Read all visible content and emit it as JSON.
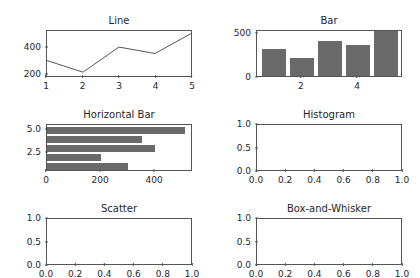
{
  "figure": {
    "background": "#ffffff",
    "bar_color": "#6a6a6a",
    "line_color": "#555555",
    "axis_color": "#555555",
    "text_color": "#262626",
    "rows": 3,
    "cols": 2
  },
  "chart_data": [
    {
      "type": "line",
      "title": "Line",
      "xlabel": "",
      "ylabel": "",
      "x": [
        1,
        2,
        3,
        4,
        5
      ],
      "values": [
        300,
        210,
        405,
        355,
        510
      ],
      "xlim": [
        1,
        5
      ],
      "ylim": [
        180,
        530
      ],
      "xticks": [
        1,
        2,
        3,
        4,
        5
      ],
      "xticklabels": [
        "1",
        "2",
        "3",
        "4",
        "5"
      ],
      "yticks": [
        200,
        400
      ],
      "yticklabels": [
        "200",
        "400"
      ],
      "grid": false,
      "legend": false
    },
    {
      "type": "bar",
      "title": "Bar",
      "xlabel": "",
      "ylabel": "",
      "categories": [
        1,
        2,
        3,
        4,
        5
      ],
      "values": [
        305,
        205,
        400,
        350,
        510
      ],
      "xlim": [
        0.4,
        5.6
      ],
      "ylim": [
        0,
        530
      ],
      "xticks": [
        2,
        4
      ],
      "xticklabels": [
        "2",
        "4"
      ],
      "yticks": [
        0,
        500
      ],
      "yticklabels": [
        "0",
        "500"
      ],
      "grid": false,
      "legend": false
    },
    {
      "type": "barh",
      "title": "Horizontal Bar",
      "xlabel": "",
      "ylabel": "",
      "categories": [
        1,
        2,
        3,
        4,
        5
      ],
      "values": [
        300,
        200,
        400,
        350,
        510
      ],
      "xlim": [
        0,
        540
      ],
      "ylim": [
        0.4,
        5.6
      ],
      "xticks": [
        0,
        200,
        400
      ],
      "xticklabels": [
        "0",
        "200",
        "400"
      ],
      "yticks": [
        2.5,
        5.0
      ],
      "yticklabels": [
        "2.5",
        "5.0"
      ],
      "grid": false,
      "legend": false
    },
    {
      "type": "histogram",
      "title": "Histogram",
      "xlabel": "",
      "ylabel": "",
      "values": [],
      "xlim": [
        0.0,
        1.0
      ],
      "ylim": [
        0.0,
        1.0
      ],
      "xticks": [
        0.0,
        0.2,
        0.4,
        0.6,
        0.8,
        1.0
      ],
      "xticklabels": [
        "0.0",
        "0.2",
        "0.4",
        "0.6",
        "0.8",
        "1.0"
      ],
      "yticks": [
        0.0,
        0.5,
        1.0
      ],
      "yticklabels": [
        "0.0",
        "0.5",
        "1.0"
      ],
      "grid": false,
      "legend": false,
      "empty": true
    },
    {
      "type": "scatter",
      "title": "Scatter",
      "xlabel": "",
      "ylabel": "",
      "x": [],
      "values": [],
      "xlim": [
        0.0,
        1.0
      ],
      "ylim": [
        0.0,
        1.0
      ],
      "xticks": [
        0.0,
        0.2,
        0.4,
        0.6,
        0.8,
        1.0
      ],
      "xticklabels": [
        "0.0",
        "0.2",
        "0.4",
        "0.6",
        "0.8",
        "1.0"
      ],
      "yticks": [
        0.0,
        0.5,
        1.0
      ],
      "yticklabels": [
        "0.0",
        "0.5",
        "1.0"
      ],
      "grid": false,
      "legend": false,
      "empty": true
    },
    {
      "type": "box",
      "title": "Box-and-Whisker",
      "xlabel": "",
      "ylabel": "",
      "values": [],
      "xlim": [
        0.0,
        1.0
      ],
      "ylim": [
        0.0,
        1.0
      ],
      "xticks": [
        0.0,
        0.2,
        0.4,
        0.6,
        0.8,
        1.0
      ],
      "xticklabels": [
        "0.0",
        "0.2",
        "0.4",
        "0.6",
        "0.8",
        "1.0"
      ],
      "yticks": [
        0.0,
        0.5,
        1.0
      ],
      "yticklabels": [
        "0.0",
        "0.5",
        "1.0"
      ],
      "grid": false,
      "legend": false,
      "empty": true
    }
  ]
}
